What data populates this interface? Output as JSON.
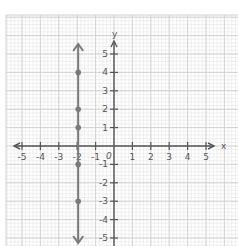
{
  "chart_data": {
    "type": "scatter",
    "title": "",
    "xlabel": "x",
    "ylabel": "y",
    "xlim": [
      -5,
      5
    ],
    "ylim": [
      -5,
      5
    ],
    "grid": true,
    "x_ticks": [
      "-5",
      "-4",
      "-3",
      "-2",
      "-1",
      "0",
      "1",
      "2",
      "3",
      "4",
      "5"
    ],
    "y_ticks": [
      "5",
      "4",
      "3",
      "2",
      "1",
      "-1",
      "-2",
      "-3",
      "-4",
      "-5"
    ],
    "origin_label": "0",
    "series": [
      {
        "name": "x = -2",
        "kind": "vertical-line",
        "x": -2,
        "points": [
          {
            "x": -2,
            "y": 4
          },
          {
            "x": -2,
            "y": 2
          },
          {
            "x": -2,
            "y": 1
          },
          {
            "x": -2,
            "y": -1
          },
          {
            "x": -2,
            "y": -3
          }
        ]
      }
    ]
  },
  "colors": {
    "grid_minor": "#e6e6e6",
    "grid_major": "#cfcfcf",
    "axis": "#555555",
    "line": "#7a7a7a",
    "point": "#7a7a7a"
  }
}
